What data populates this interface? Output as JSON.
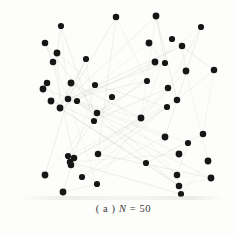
{
  "figure": {
    "caption": {
      "index_label": "( a ) ",
      "variable": "N",
      "value_text": " = 50"
    }
  },
  "network": {
    "node_count": 50,
    "node_color": "#161616",
    "edge_color": "#c8c6be",
    "background": "#fdfdfb",
    "nodes": [
      [
        61,
        26
      ],
      [
        116,
        17
      ],
      [
        156,
        16
      ],
      [
        201,
        27
      ],
      [
        45,
        43
      ],
      [
        149,
        43
      ],
      [
        172,
        39
      ],
      [
        182,
        46
      ],
      [
        57,
        53
      ],
      [
        86,
        59
      ],
      [
        53,
        62
      ],
      [
        155,
        62
      ],
      [
        165,
        63
      ],
      [
        214,
        70
      ],
      [
        186,
        71
      ],
      [
        147,
        81
      ],
      [
        47,
        83
      ],
      [
        71,
        83
      ],
      [
        95,
        85
      ],
      [
        168,
        88
      ],
      [
        43,
        89
      ],
      [
        112,
        97
      ],
      [
        68,
        99
      ],
      [
        51,
        101
      ],
      [
        77,
        101
      ],
      [
        177,
        100
      ],
      [
        60,
        108
      ],
      [
        167,
        107
      ],
      [
        97,
        113
      ],
      [
        141,
        118
      ],
      [
        94,
        121
      ],
      [
        203,
        134
      ],
      [
        165,
        137
      ],
      [
        188,
        143
      ],
      [
        98,
        154
      ],
      [
        179,
        154
      ],
      [
        68,
        156
      ],
      [
        74,
        158
      ],
      [
        208,
        161
      ],
      [
        146,
        163
      ],
      [
        70,
        162
      ],
      [
        45,
        175
      ],
      [
        82,
        177
      ],
      [
        177,
        175
      ],
      [
        211,
        178
      ],
      [
        97,
        184
      ],
      [
        179,
        186
      ],
      [
        63,
        192
      ],
      [
        181,
        194
      ],
      [
        71,
        165
      ]
    ],
    "edges": [
      [
        0,
        8
      ],
      [
        0,
        22
      ],
      [
        0,
        30
      ],
      [
        1,
        22
      ],
      [
        1,
        15
      ],
      [
        1,
        34
      ],
      [
        2,
        12
      ],
      [
        2,
        29
      ],
      [
        2,
        22
      ],
      [
        2,
        25
      ],
      [
        3,
        11
      ],
      [
        3,
        19
      ],
      [
        3,
        32
      ],
      [
        4,
        22
      ],
      [
        4,
        10
      ],
      [
        4,
        28
      ],
      [
        5,
        24
      ],
      [
        5,
        12
      ],
      [
        6,
        13
      ],
      [
        6,
        29
      ],
      [
        7,
        14
      ],
      [
        7,
        22
      ],
      [
        8,
        26
      ],
      [
        8,
        18
      ],
      [
        9,
        22
      ],
      [
        9,
        30
      ],
      [
        10,
        37
      ],
      [
        11,
        26
      ],
      [
        11,
        21
      ],
      [
        12,
        30
      ],
      [
        12,
        22
      ],
      [
        13,
        31
      ],
      [
        13,
        25
      ],
      [
        14,
        29
      ],
      [
        14,
        38
      ],
      [
        15,
        22
      ],
      [
        15,
        28
      ],
      [
        16,
        26
      ],
      [
        17,
        26
      ],
      [
        17,
        29
      ],
      [
        18,
        37
      ],
      [
        18,
        27
      ],
      [
        19,
        30
      ],
      [
        19,
        34
      ],
      [
        20,
        24
      ],
      [
        21,
        36
      ],
      [
        21,
        43
      ],
      [
        22,
        32
      ],
      [
        22,
        41
      ],
      [
        22,
        45
      ],
      [
        22,
        35
      ],
      [
        23,
        30
      ],
      [
        24,
        33
      ],
      [
        24,
        46
      ],
      [
        25,
        34
      ],
      [
        25,
        36
      ],
      [
        26,
        39
      ],
      [
        26,
        46
      ],
      [
        27,
        37
      ],
      [
        28,
        43
      ],
      [
        29,
        37
      ],
      [
        29,
        45
      ],
      [
        30,
        44
      ],
      [
        31,
        39
      ],
      [
        32,
        42
      ],
      [
        33,
        43
      ],
      [
        34,
        44
      ],
      [
        35,
        40
      ],
      [
        36,
        45
      ],
      [
        37,
        47
      ],
      [
        38,
        48
      ],
      [
        39,
        46
      ],
      [
        40,
        48
      ],
      [
        41,
        28
      ],
      [
        42,
        27
      ],
      [
        43,
        48
      ],
      [
        44,
        46
      ],
      [
        45,
        47
      ],
      [
        9,
        26
      ],
      [
        22,
        29
      ]
    ]
  }
}
